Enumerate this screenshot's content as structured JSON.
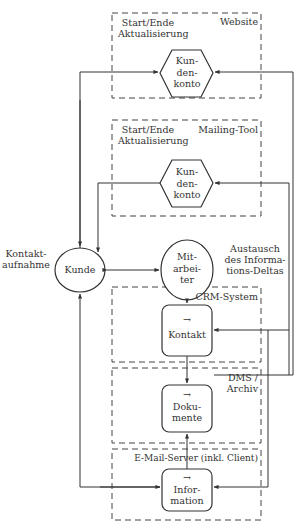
{
  "diagram": {
    "systems": {
      "website": {
        "title": "Website",
        "note": [
          "Start/Ende",
          "Aktualisierung"
        ],
        "node": [
          "Kun-",
          "den-",
          "konto"
        ]
      },
      "mailing_tool": {
        "title": "Mailing-Tool",
        "note": [
          "Start/Ende",
          "Aktualisierung"
        ],
        "node": [
          "Kun-",
          "den-",
          "konto"
        ]
      },
      "crm": {
        "title": "CRM-System",
        "node": {
          "arrow": "→",
          "label": "Kontakt"
        }
      },
      "dms": {
        "title": [
          "DMS /",
          "Archiv"
        ],
        "node": {
          "arrow": "→",
          "label": [
            "Doku-",
            "mente"
          ]
        }
      },
      "email": {
        "title": "E-Mail-Server (inkl. Client)",
        "node": {
          "arrow": "→",
          "label": [
            "Infor-",
            "mation"
          ]
        }
      }
    },
    "actors": {
      "kunde": {
        "label": "Kunde",
        "side_note": [
          "Kontakt-",
          "aufnahme"
        ]
      },
      "mitarbeiter": {
        "label": [
          "Mit-",
          "arbei-",
          "ter"
        ]
      }
    },
    "annotations": {
      "exchange": [
        "Austausch",
        "des Informa-",
        "tions-Deltas"
      ]
    },
    "colors": {
      "stroke": "#333333",
      "background": "#ffffff"
    }
  }
}
